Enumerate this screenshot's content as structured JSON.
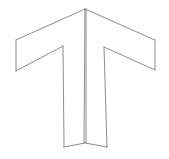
{
  "canvas": {
    "width": 169,
    "height": 159,
    "background_color": "#ffffff"
  },
  "figure": {
    "name": "t-shape-line-drawing",
    "stroke_color": "#808080",
    "stroke_color_light": "#a0a0a0",
    "fill_color": "#ffffff",
    "stroke_width": 0.9,
    "vertices": {
      "apex": [
        85,
        9
      ],
      "left_arm_top_outer": [
        16,
        40
      ],
      "left_arm_bottom_outer": [
        16,
        71
      ],
      "left_armpit": [
        63,
        46
      ],
      "right_arm_top_outer": [
        155,
        40
      ],
      "right_arm_bottom_outer": [
        155,
        70
      ],
      "right_armpit": [
        104,
        47
      ],
      "stem_left_bottom": [
        64,
        147
      ],
      "stem_right_bottom": [
        107,
        147
      ],
      "fold_bottom": [
        85,
        143
      ]
    },
    "paths": {
      "left_panel": "M 85 9 L 16 40 L 16 71 L 63 46 Z",
      "right_panel": "M 85 9 L 155 40 L 155 70 L 104 47 Z",
      "stem_left_panel": "M 63 46 L 85 10 L 85 143 L 64 147 Z",
      "stem_right_panel": "M 104 47 L 85 10 L 85 143 L 107 147 Z",
      "left_arm_top_edge": "M 85 9 L 16 40",
      "left_arm_outer_edge": "M 16 40 L 16 71",
      "left_arm_bottom_edge": "M 16 71 L 63 46",
      "right_arm_top_edge": "M 85 9 L 155 40",
      "right_arm_outer_edge": "M 155 40 L 155 70",
      "right_arm_bottom_edge": "M 155 70 L 104 47",
      "stem_left_edge": "M 63 46 L 64 147",
      "stem_right_edge": "M 104 47 L 107 147",
      "center_fold_left": "M 85 9 L 84 143",
      "center_fold_right": "M 86 9 L 86 143",
      "bottom_left_edge": "M 64 147 L 85 143",
      "bottom_right_edge": "M 107 147 L 85 143"
    }
  }
}
